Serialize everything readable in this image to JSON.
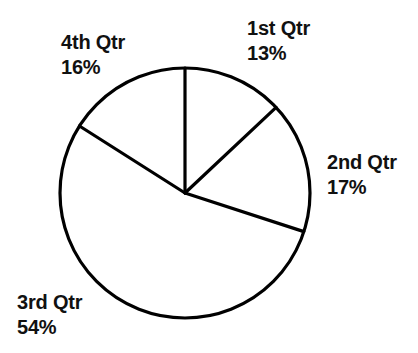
{
  "chart_data": {
    "type": "pie",
    "title": "",
    "subtitle": "",
    "xlabel": "",
    "ylabel": "",
    "legend_position": "none",
    "grid": false,
    "start_angle_deg": 0,
    "direction": "clockwise",
    "categories": [
      "1st Qtr",
      "2nd Qtr",
      "3rd Qtr",
      "4th Qtr"
    ],
    "values": [
      13,
      17,
      54,
      16
    ],
    "value_suffix": "%",
    "slice_color": "#ffffff",
    "outline_color": "#000000",
    "labels": [
      {
        "name": "1st Qtr",
        "value": "13%"
      },
      {
        "name": "2nd Qtr",
        "value": "17%"
      },
      {
        "name": "3rd Qtr",
        "value": "54%"
      },
      {
        "name": "4th Qtr",
        "value": "16%"
      }
    ]
  },
  "chart": {
    "q1": {
      "name": "1st Qtr",
      "value": "13%"
    },
    "q2": {
      "name": "2nd Qtr",
      "value": "17%"
    },
    "q3": {
      "name": "3rd Qtr",
      "value": "54%"
    },
    "q4": {
      "name": "4th Qtr",
      "value": "16%"
    }
  }
}
